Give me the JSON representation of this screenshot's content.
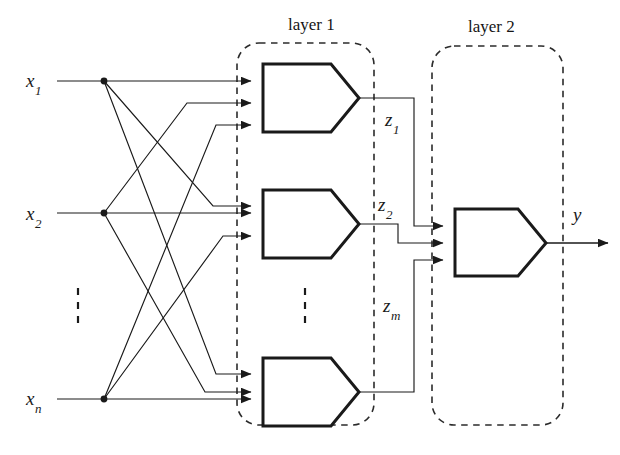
{
  "figure": {
    "width": 620,
    "height": 455,
    "background": "#ffffff",
    "ink_color": "#1a1a1a",
    "dashed_color": "#2b2b2b"
  },
  "layers": [
    {
      "id": "layer-1",
      "label": "layer 1",
      "title_x": 288,
      "title_y": 16,
      "box": {
        "x": 237,
        "y": 43,
        "w": 137,
        "h": 382,
        "r": 22
      }
    },
    {
      "id": "layer-2",
      "label": "layer 2",
      "title_x": 468,
      "title_y": 18,
      "box": {
        "x": 432,
        "y": 46,
        "w": 131,
        "h": 379,
        "r": 22
      }
    }
  ],
  "inputs": [
    {
      "id": "x1",
      "base": "x",
      "sub": "1",
      "label_x": 26,
      "label_y": 71,
      "dot_x": 104,
      "dot_y": 81,
      "line_from_x": 57
    },
    {
      "id": "x2",
      "base": "x",
      "sub": "2",
      "label_x": 26,
      "label_y": 204,
      "dot_x": 104,
      "dot_y": 213,
      "line_from_x": 57
    },
    {
      "id": "xn",
      "base": "x",
      "sub": "n",
      "label_x": 26,
      "label_y": 389,
      "dot_x": 104,
      "dot_y": 399,
      "line_from_x": 57
    }
  ],
  "hidden_neurons": [
    {
      "id": "neuron-1",
      "x": 263,
      "y": 64,
      "w": 96,
      "h": 68,
      "output_label": {
        "base": "z",
        "sub": "1",
        "label_x": 385,
        "label_y": 110
      }
    },
    {
      "id": "neuron-2",
      "x": 263,
      "y": 190,
      "w": 96,
      "h": 68,
      "output_label": {
        "base": "z",
        "sub": "2",
        "label_x": 378,
        "label_y": 195
      }
    },
    {
      "id": "neuron-m",
      "x": 263,
      "y": 358,
      "w": 96,
      "h": 68,
      "output_label": {
        "base": "z",
        "sub": "m",
        "label_x": 383,
        "label_y": 296
      }
    }
  ],
  "output_neuron": {
    "id": "neuron-output",
    "x": 455,
    "y": 209,
    "w": 91,
    "h": 67
  },
  "output_signal": {
    "id": "y",
    "base": "y",
    "sub": "",
    "label_x": 573,
    "label_y": 205,
    "arrow_to_x": 614,
    "arrow_y": 243
  },
  "ellipses": [
    {
      "id": "input-ellipsis",
      "x": 78,
      "y": 290,
      "dots": 3
    },
    {
      "id": "hidden-ellipsis",
      "x": 305,
      "y": 290,
      "dots": 3
    }
  ],
  "connections": {
    "note": "each input fans out to all three hidden neurons; each hidden neuron feeds the output neuron",
    "input_to_hidden_count": 9,
    "hidden_to_output_count": 3
  },
  "arrow_marker": {
    "width": 11,
    "height": 9
  }
}
